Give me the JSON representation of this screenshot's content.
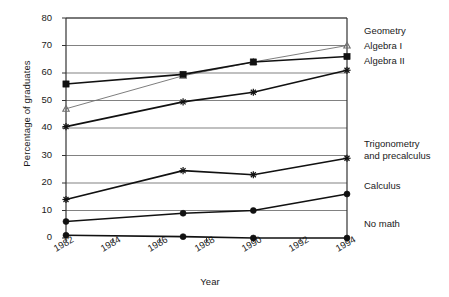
{
  "chart_data": {
    "type": "line",
    "title": "",
    "xlabel": "Year",
    "ylabel": "Percentage of graduates",
    "x": [
      1982,
      1987,
      1990,
      1994
    ],
    "xlim": [
      1982,
      1994
    ],
    "ylim": [
      0,
      80
    ],
    "grid": true,
    "legend_position": "right-inline",
    "xticks": [
      "1982",
      "1984",
      "1986",
      "1988",
      "1990",
      "1992",
      "1994"
    ],
    "xtick_values": [
      1982,
      1984,
      1986,
      1988,
      1990,
      1992,
      1994
    ],
    "yticks": [
      "0",
      "10",
      "20",
      "30",
      "40",
      "50",
      "60",
      "70",
      "80"
    ],
    "ytick_values": [
      0,
      10,
      20,
      30,
      40,
      50,
      60,
      70,
      80
    ],
    "series": [
      {
        "name": "Geometry",
        "marker": "triangle",
        "values": [
          47,
          59,
          64,
          70
        ],
        "label_x": 364,
        "label_y": 30
      },
      {
        "name": "Algebra I",
        "marker": "square",
        "values": [
          56,
          59.5,
          64,
          66
        ],
        "label_x": 364,
        "label_y": 44
      },
      {
        "name": "Algebra II",
        "marker": "star",
        "values": [
          40.5,
          49.5,
          53,
          61
        ],
        "label_x": 364,
        "label_y": 58
      },
      {
        "name": "Trigonometry and precalculus",
        "marker": "star",
        "values": [
          14,
          24.5,
          23,
          29
        ],
        "label_x": 364,
        "label_y": 163,
        "label_line1": "Trigonometry",
        "label_line2": "and precalculus"
      },
      {
        "name": "Calculus",
        "marker": "circle",
        "values": [
          6,
          9,
          10,
          16
        ],
        "label_x": 364,
        "label_y": 204
      },
      {
        "name": "No math",
        "marker": "circle",
        "values": [
          1,
          0.5,
          0,
          0
        ],
        "label_x": 364,
        "label_y": 240
      }
    ]
  },
  "axes": {
    "y_title": "Percentage of graduates",
    "x_title": "Year"
  },
  "ytick_labels": [
    "80",
    "70",
    "60",
    "50",
    "40",
    "30",
    "20",
    "10",
    "0"
  ],
  "xtick_labels": [
    "1982",
    "1984",
    "1986",
    "1988",
    "1990",
    "1992",
    "1994"
  ],
  "series_labels": {
    "geometry": "Geometry",
    "algebra_i": "Algebra I",
    "algebra_ii": "Algebra II",
    "trig_line1": "Trigonometry",
    "trig_line2": "and precalculus",
    "calculus": "Calculus",
    "no_math": "No math"
  },
  "colors": {
    "line": "#111111",
    "light_line": "#6e6e6e",
    "grid": "#4a4a4a",
    "axis": "#333333",
    "text": "#1a1a1a"
  },
  "caption": ""
}
